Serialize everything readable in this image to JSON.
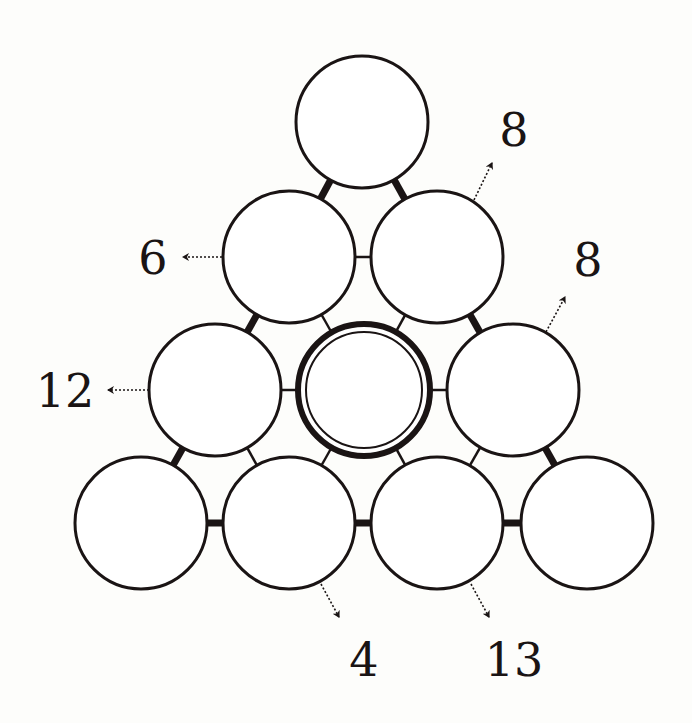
{
  "diagram": {
    "type": "number-pyramid-puzzle",
    "colors": {
      "stroke": "#1a1414",
      "background": "#fdfdfb",
      "fill": "#ffffff"
    },
    "circle_radius": 66,
    "circles": [
      {
        "id": "r1c1",
        "row": 1,
        "col": 1,
        "cx": 362,
        "cy": 122,
        "value": "",
        "highlighted": false
      },
      {
        "id": "r2c1",
        "row": 2,
        "col": 1,
        "cx": 289,
        "cy": 257,
        "value": "",
        "highlighted": false
      },
      {
        "id": "r2c2",
        "row": 2,
        "col": 2,
        "cx": 437,
        "cy": 257,
        "value": "",
        "highlighted": false
      },
      {
        "id": "r3c1",
        "row": 3,
        "col": 1,
        "cx": 215,
        "cy": 390,
        "value": "",
        "highlighted": false
      },
      {
        "id": "r3c2",
        "row": 3,
        "col": 2,
        "cx": 364,
        "cy": 390,
        "value": "",
        "highlighted": true
      },
      {
        "id": "r3c3",
        "row": 3,
        "col": 3,
        "cx": 513,
        "cy": 390,
        "value": "",
        "highlighted": false
      },
      {
        "id": "r4c1",
        "row": 4,
        "col": 1,
        "cx": 141,
        "cy": 523,
        "value": "",
        "highlighted": false
      },
      {
        "id": "r4c2",
        "row": 4,
        "col": 2,
        "cx": 289,
        "cy": 523,
        "value": "",
        "highlighted": false
      },
      {
        "id": "r4c3",
        "row": 4,
        "col": 3,
        "cx": 437,
        "cy": 523,
        "value": "",
        "highlighted": false
      },
      {
        "id": "r4c4",
        "row": 4,
        "col": 4,
        "cx": 587,
        "cy": 523,
        "value": "",
        "highlighted": false
      }
    ],
    "connectors": [
      {
        "from": "r1c1",
        "to": "r2c1",
        "weight": "thick"
      },
      {
        "from": "r1c1",
        "to": "r2c2",
        "weight": "thick"
      },
      {
        "from": "r2c1",
        "to": "r2c2",
        "weight": "thin"
      },
      {
        "from": "r2c1",
        "to": "r3c1",
        "weight": "thick"
      },
      {
        "from": "r2c1",
        "to": "r3c2",
        "weight": "thin"
      },
      {
        "from": "r2c2",
        "to": "r3c2",
        "weight": "thin"
      },
      {
        "from": "r2c2",
        "to": "r3c3",
        "weight": "thick"
      },
      {
        "from": "r3c1",
        "to": "r3c2",
        "weight": "thin"
      },
      {
        "from": "r3c2",
        "to": "r3c3",
        "weight": "thin"
      },
      {
        "from": "r3c1",
        "to": "r4c1",
        "weight": "thick"
      },
      {
        "from": "r3c1",
        "to": "r4c2",
        "weight": "thin"
      },
      {
        "from": "r3c2",
        "to": "r4c2",
        "weight": "thin"
      },
      {
        "from": "r3c2",
        "to": "r4c3",
        "weight": "thin"
      },
      {
        "from": "r3c3",
        "to": "r4c3",
        "weight": "thin"
      },
      {
        "from": "r3c3",
        "to": "r4c4",
        "weight": "thick"
      },
      {
        "from": "r4c1",
        "to": "r4c2",
        "weight": "thick"
      },
      {
        "from": "r4c2",
        "to": "r4c3",
        "weight": "thick"
      },
      {
        "from": "r4c3",
        "to": "r4c4",
        "weight": "thick"
      }
    ],
    "clues": [
      {
        "id": "clue-top-right",
        "value": "8",
        "x": 514,
        "y": 130,
        "arrow": {
          "x1": 474,
          "y1": 200,
          "x2": 492,
          "y2": 163
        },
        "points_from": "r2c2",
        "direction": "up-right"
      },
      {
        "id": "clue-left-row2",
        "value": "6",
        "x": 153,
        "y": 258,
        "arrow": {
          "x1": 222,
          "y1": 257,
          "x2": 183,
          "y2": 257
        },
        "points_from": "r2c1",
        "direction": "left"
      },
      {
        "id": "clue-right-row3",
        "value": "8",
        "x": 588,
        "y": 260,
        "arrow": {
          "x1": 546,
          "y1": 332,
          "x2": 565,
          "y2": 297
        },
        "points_from": "r3c3",
        "direction": "up-right"
      },
      {
        "id": "clue-left-row3",
        "value": "12",
        "x": 65,
        "y": 391,
        "arrow": {
          "x1": 149,
          "y1": 390,
          "x2": 108,
          "y2": 390
        },
        "points_from": "r3c1",
        "direction": "left"
      },
      {
        "id": "clue-bottom-4",
        "value": "4",
        "x": 364,
        "y": 660,
        "arrow": {
          "x1": 321,
          "y1": 584,
          "x2": 339,
          "y2": 617
        },
        "points_from": "r4c2",
        "direction": "down-right"
      },
      {
        "id": "clue-bottom-13",
        "value": "13",
        "x": 514,
        "y": 660,
        "arrow": {
          "x1": 471,
          "y1": 584,
          "x2": 489,
          "y2": 617
        },
        "points_from": "r4c3",
        "direction": "down-right"
      }
    ]
  }
}
